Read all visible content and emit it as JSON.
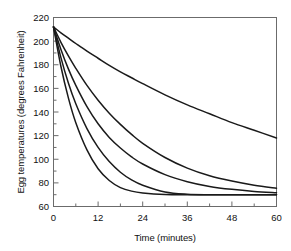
{
  "chart_data": {
    "type": "line",
    "title": "",
    "xlabel": "Time (minutes)",
    "ylabel": "Egg temperatures (degrees Fahrenheit)",
    "xlim": [
      0,
      60
    ],
    "ylim": [
      60,
      220
    ],
    "xticks": [
      0,
      12,
      24,
      36,
      48,
      60
    ],
    "yticks": [
      60,
      80,
      100,
      120,
      140,
      160,
      180,
      200,
      220
    ],
    "x_minor_tick_interval": 6,
    "y_minor_tick_interval": 10,
    "grid": false,
    "legend": "none",
    "line_color": "#1a1a1a",
    "frame_color": "#6b6b6b",
    "x": [
      0,
      2,
      4,
      6,
      9,
      12,
      15,
      18,
      21,
      24,
      30,
      36,
      42,
      48,
      54,
      60
    ],
    "series": [
      {
        "name": "curve-1-slowest",
        "values": [
          212,
          207,
          202.5,
          198,
          191.5,
          185.5,
          179.5,
          174,
          169,
          164,
          154.5,
          146,
          138.5,
          131,
          124.5,
          118
        ]
      },
      {
        "name": "curve-2",
        "values": [
          212,
          199,
          187.5,
          177,
          162.5,
          150,
          139,
          129.5,
          121,
          113.5,
          101.5,
          92.5,
          86,
          81.5,
          78,
          75.5
        ]
      },
      {
        "name": "curve-3",
        "values": [
          212,
          193,
          176.5,
          162.5,
          144.5,
          130,
          118.5,
          109.5,
          102,
          96,
          87,
          81,
          77,
          74.5,
          72.8,
          71.7
        ]
      },
      {
        "name": "curve-4",
        "values": [
          212,
          186,
          164.5,
          147,
          126,
          110,
          98,
          89,
          82.5,
          78,
          72.3,
          70.4,
          70,
          70,
          70,
          70
        ]
      },
      {
        "name": "curve-5-fastest",
        "values": [
          212,
          178.5,
          152,
          131,
          108,
          92,
          82,
          76,
          73,
          71.5,
          70.2,
          70,
          70,
          70,
          70,
          70
        ]
      }
    ],
    "initial_temperature": 212,
    "ambient_temperature": 70
  },
  "axes": {
    "x_tick_labels": [
      "0",
      "12",
      "24",
      "36",
      "48",
      "60"
    ],
    "y_tick_labels": [
      "60",
      "80",
      "100",
      "120",
      "140",
      "160",
      "180",
      "200",
      "220"
    ]
  }
}
